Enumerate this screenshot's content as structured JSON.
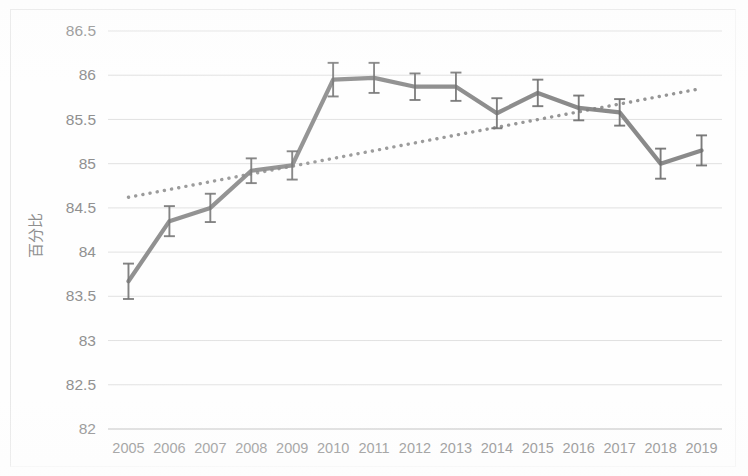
{
  "chart_data": {
    "type": "line",
    "title": "",
    "subtitle": "",
    "xlabel": "",
    "ylabel": "百分比",
    "categories": [
      "2005",
      "2006",
      "2007",
      "2008",
      "2009",
      "2010",
      "2011",
      "2012",
      "2013",
      "2014",
      "2015",
      "2016",
      "2017",
      "2018",
      "2019"
    ],
    "x": [
      2005,
      2006,
      2007,
      2008,
      2009,
      2010,
      2011,
      2012,
      2013,
      2014,
      2015,
      2016,
      2017,
      2018,
      2019
    ],
    "ylim": [
      82,
      86.5
    ],
    "ytick_labels": [
      "86.5",
      "86",
      "85.5",
      "85",
      "84.5",
      "84",
      "83.5",
      "83",
      "82.5",
      "82"
    ],
    "ytick_values": [
      86.5,
      86,
      85.5,
      85,
      84.5,
      84,
      83.5,
      83,
      82.5,
      82
    ],
    "grid": true,
    "legend": "none",
    "series": [
      {
        "name": "百分比",
        "style": "solid-line-with-error-bars",
        "color": "#808080",
        "values": [
          83.67,
          84.35,
          84.5,
          84.92,
          84.98,
          85.95,
          85.97,
          85.87,
          85.87,
          85.57,
          85.8,
          85.63,
          85.58,
          85.0,
          85.15
        ],
        "error_upper": [
          0.2,
          0.17,
          0.16,
          0.14,
          0.16,
          0.19,
          0.17,
          0.15,
          0.16,
          0.17,
          0.15,
          0.14,
          0.15,
          0.17,
          0.17
        ],
        "error_lower": [
          0.2,
          0.17,
          0.16,
          0.14,
          0.16,
          0.19,
          0.17,
          0.15,
          0.16,
          0.17,
          0.15,
          0.14,
          0.15,
          0.17,
          0.17
        ]
      },
      {
        "name": "趋势线",
        "style": "dotted-trendline",
        "color": "#8a8a8a",
        "endpoints": [
          {
            "x": 2005,
            "y": 84.62
          },
          {
            "x": 2019,
            "y": 85.85
          }
        ]
      }
    ]
  },
  "axes": {
    "y_axis_title": "百分比",
    "y_tick_labels": [
      "86.5",
      "86",
      "85.5",
      "85",
      "84.5",
      "84",
      "83.5",
      "83",
      "82.5",
      "82"
    ],
    "x_tick_labels": [
      "2005",
      "2006",
      "2007",
      "2008",
      "2009",
      "2010",
      "2011",
      "2012",
      "2013",
      "2014",
      "2015",
      "2016",
      "2017",
      "2018",
      "2019"
    ]
  },
  "colors": {
    "series_line": "#808080",
    "trend_line": "#8a8a8a",
    "gridline": "#dcdcdc",
    "tick_text": "#8c8c8c",
    "background": "#ffffff"
  }
}
